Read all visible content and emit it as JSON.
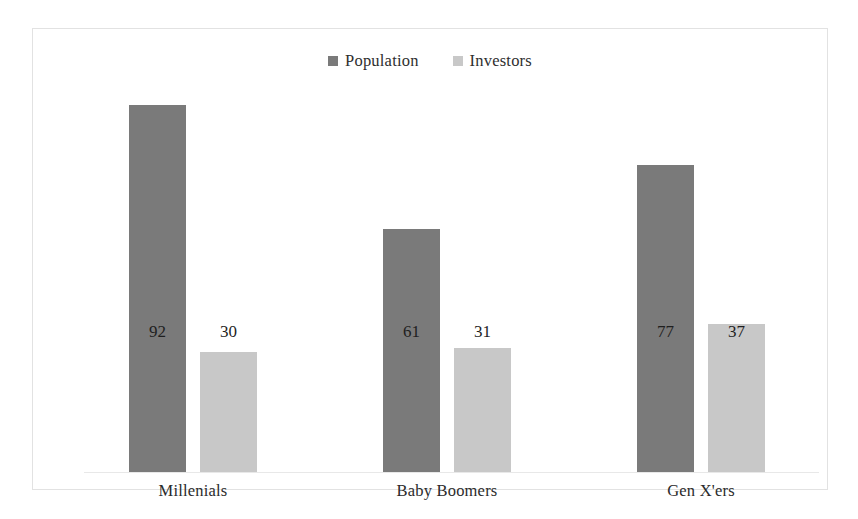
{
  "chart_data": {
    "type": "bar",
    "title": "",
    "subtitle": "",
    "xlabel": "",
    "ylabel": "",
    "ylim": [
      0,
      100
    ],
    "grid": false,
    "legend_position": "top-center",
    "categories": [
      "Millenials",
      "Baby Boomers",
      "Gen X'ers"
    ],
    "series": [
      {
        "name": "Population",
        "color": "#7a7a7a",
        "values": [
          92,
          61,
          77
        ],
        "labels": [
          "92",
          "61",
          "77"
        ]
      },
      {
        "name": "Investors",
        "color": "#c8c8c8",
        "values": [
          30,
          31,
          37
        ],
        "labels": [
          "30",
          "31",
          "37"
        ]
      }
    ]
  },
  "legend": {
    "entries": [
      {
        "label": "Population",
        "swatch_name": "legend-swatch-population"
      },
      {
        "label": "Investors",
        "swatch_name": "legend-swatch-investors"
      }
    ]
  },
  "colors": {
    "population": "#7a7a7a",
    "investors": "#c8c8c8",
    "frame_border": "#e2e2e2",
    "axis_line": "#e8e8e8",
    "value_text": "#1f1f1f",
    "label_text": "#2b2b2b",
    "background": "#ffffff"
  }
}
